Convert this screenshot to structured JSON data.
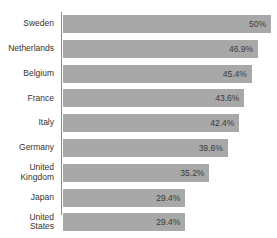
{
  "chart_data": {
    "type": "bar",
    "orientation": "horizontal",
    "title": "",
    "xlabel": "",
    "ylabel": "",
    "grid": false,
    "legend": false,
    "value_suffix": "%",
    "xlim": [
      0,
      50
    ],
    "categories": [
      "Sweden",
      "Netherlands",
      "Belgium",
      "France",
      "Italy",
      "Germany",
      "United\nKingdom",
      "Japan",
      "United\nStates"
    ],
    "values": [
      50,
      46.9,
      45.4,
      43.6,
      42.4,
      39.6,
      35.2,
      29.4,
      29.4
    ],
    "value_labels": [
      "50%",
      "46.9%",
      "45.4%",
      "43.6%",
      "42.4%",
      "39.6%",
      "35.2%",
      "29.4%",
      "29.4%"
    ],
    "bars": [
      {
        "category": "Sweden",
        "label": "Sweden",
        "value": 50,
        "value_label": "50%"
      },
      {
        "category": "Netherlands",
        "label": "Netherlands",
        "value": 46.9,
        "value_label": "46.9%"
      },
      {
        "category": "Belgium",
        "label": "Belgium",
        "value": 45.4,
        "value_label": "45.4%"
      },
      {
        "category": "France",
        "label": "France",
        "value": 43.6,
        "value_label": "43.6%"
      },
      {
        "category": "Italy",
        "label": "Italy",
        "value": 42.4,
        "value_label": "42.4%"
      },
      {
        "category": "Germany",
        "label": "Germany",
        "value": 39.6,
        "value_label": "39.6%"
      },
      {
        "category": "United Kingdom",
        "label": "United\nKingdom",
        "value": 35.2,
        "value_label": "35.2%"
      },
      {
        "category": "Japan",
        "label": "Japan",
        "value": 29.4,
        "value_label": "29.4%"
      },
      {
        "category": "United States",
        "label": "United\nStates",
        "value": 29.4,
        "value_label": "29.4%"
      }
    ]
  },
  "colors": {
    "bar_fill": "#a8a8a8",
    "axis_line": "#8c8c8c",
    "category_text": "#333333",
    "value_text": "#3a3a3a",
    "background": "#ffffff"
  }
}
